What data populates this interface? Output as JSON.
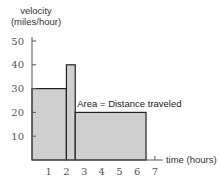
{
  "chart_data": {
    "type": "bar",
    "title": "",
    "ylabel": "velocity (miles/hour)",
    "ylabel_lines": [
      "velocity",
      "(miles/hour)"
    ],
    "xlabel": "time (hours)",
    "xlim": [
      0,
      7
    ],
    "ylim": [
      0,
      50
    ],
    "xticks": [
      1,
      2,
      3,
      4,
      5,
      6,
      7
    ],
    "yticks": [
      10,
      20,
      30,
      40,
      50
    ],
    "grid": false,
    "segments": [
      {
        "x_start": 0,
        "x_end": 2,
        "velocity": 30
      },
      {
        "x_start": 2,
        "x_end": 2.5,
        "velocity": 40
      },
      {
        "x_start": 2.5,
        "x_end": 6.5,
        "velocity": 20
      }
    ],
    "annotations": [
      "Area = Distance traveled"
    ],
    "fill_color": "#cfcfcf",
    "edge_color": "#222222"
  }
}
